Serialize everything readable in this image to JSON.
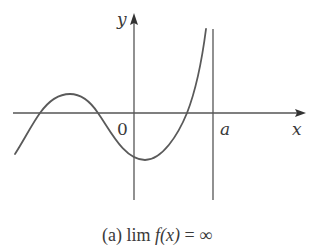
{
  "figure": {
    "axes": {
      "x_label": "x",
      "y_label": "y",
      "origin_label": "0",
      "asymptote_label": "a"
    },
    "colors": {
      "stroke": "#555555",
      "curve": "#5a5a5a",
      "text": "#3a3a3a"
    },
    "curve_description": "Cubic-like curve rising from lower left, local max left of y-axis, local min just right of y-axis, then rising steeply toward +infinity as x approaches a from the left",
    "vertical_asymptote": "x = a"
  },
  "caption": {
    "prefix": "(a) lim ",
    "function": "f(x)",
    "suffix": " = ∞"
  }
}
